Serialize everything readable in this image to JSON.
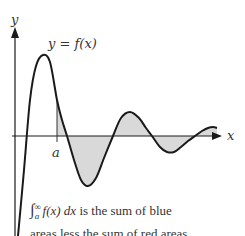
{
  "diagram": {
    "y_axis_label": "y",
    "x_axis_label": "x",
    "curve_label": "y = f(x)",
    "lower_limit_label": "a",
    "shading_color": "#d9d9d9",
    "curve_color": "#1a1a1a",
    "caption": {
      "integral_symbol": "∫",
      "upper_limit": "∞",
      "lower_limit": "a",
      "integrand": "f(x) dx",
      "text_line1": " is the sum of blue",
      "text_line2": "areas less the sum of red areas"
    }
  }
}
